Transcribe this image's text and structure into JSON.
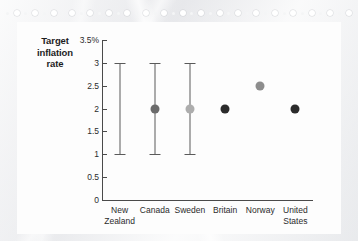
{
  "figure": {
    "title_line1": "Target",
    "title_line2": "inflation",
    "title_line3": "rate"
  },
  "chart_data": {
    "type": "scatter",
    "title": "Target inflation rate",
    "xlabel": "",
    "ylabel": "Target inflation rate",
    "ylim": [
      0,
      3.5
    ],
    "grid": false,
    "legend": false,
    "y_unit": "%",
    "yticks": [
      0,
      0.5,
      1,
      1.5,
      2,
      2.5,
      3,
      3.5
    ],
    "ytick_labels": [
      "0",
      "0.5",
      "1",
      "1.5",
      "2",
      "2.5",
      "3",
      "3.5%"
    ],
    "categories": [
      "New Zealand",
      "Canada",
      "Sweden",
      "Britain",
      "Norway",
      "United States"
    ],
    "series": [
      {
        "name": "Target point",
        "values": [
          null,
          2,
          2,
          2,
          2.5,
          2
        ],
        "colors": [
          "",
          "#6b6b6b",
          "#adadad",
          "#2b2b2b",
          "#8d8d8d",
          "#2b2b2b"
        ]
      },
      {
        "name": "Target range",
        "low": [
          1,
          1,
          1,
          null,
          null,
          null
        ],
        "high": [
          3,
          3,
          3,
          null,
          null,
          null
        ]
      }
    ],
    "points": [
      {
        "category": "New Zealand",
        "label_line1": "New",
        "label_line2": "Zealand",
        "value": null,
        "range_low": 1,
        "range_high": 3,
        "dot_color": ""
      },
      {
        "category": "Canada",
        "label_line1": "Canada",
        "label_line2": "",
        "value": 2,
        "range_low": 1,
        "range_high": 3,
        "dot_color": "#6b6b6b"
      },
      {
        "category": "Sweden",
        "label_line1": "Sweden",
        "label_line2": "",
        "value": 2,
        "range_low": 1,
        "range_high": 3,
        "dot_color": "#adadad"
      },
      {
        "category": "Britain",
        "label_line1": "Britain",
        "label_line2": "",
        "value": 2,
        "range_low": null,
        "range_high": null,
        "dot_color": "#2b2b2b"
      },
      {
        "category": "Norway",
        "label_line1": "Norway",
        "label_line2": "",
        "value": 2.5,
        "range_low": null,
        "range_high": null,
        "dot_color": "#8d8d8d"
      },
      {
        "category": "United States",
        "label_line1": "United",
        "label_line2": "States",
        "value": 2,
        "range_low": null,
        "range_high": null,
        "dot_color": "#2b2b2b"
      }
    ]
  },
  "colors": {
    "axis": "#4a4a4a",
    "range_bar": "#5a5a5a",
    "text": "#2b2b2b",
    "panel_background": "#fdfdfd",
    "page_background": "#e9eaec"
  }
}
